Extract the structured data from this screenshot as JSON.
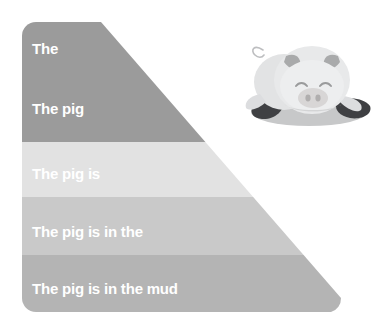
{
  "diagram": {
    "type": "sentence-building-pyramid",
    "title": "The pig is in the mud",
    "bands": [
      {
        "id": "band-1",
        "text": "The",
        "color": "#9b9b9b",
        "words": 1
      },
      {
        "id": "band-2",
        "text": "The pig",
        "color": "#9b9b9b",
        "words": 2
      },
      {
        "id": "band-3",
        "text": "The pig is",
        "color": "#e2e2e2",
        "words": 3
      },
      {
        "id": "band-4",
        "text": "The pig is in the",
        "color": "#c9c9c9",
        "words": 5
      },
      {
        "id": "band-5",
        "text": "The pig is in the mud",
        "color": "#b4b4b4",
        "words": 6
      }
    ],
    "text_color": "#ffffff",
    "background": "#ffffff"
  },
  "illustration": {
    "name": "pig-in-mud",
    "subject": "pig",
    "expression": "smiling-closed-eyes",
    "colors": {
      "body": "#e8e9ea",
      "body_shade": "#d3d4d5",
      "ear": "#a9aaab",
      "snout": "#d8d6d6",
      "nostril": "#b0aeae",
      "mud_light": "#c7c8c9",
      "mud_dark": "#3f4043",
      "outline": "#9a9b9c"
    }
  }
}
